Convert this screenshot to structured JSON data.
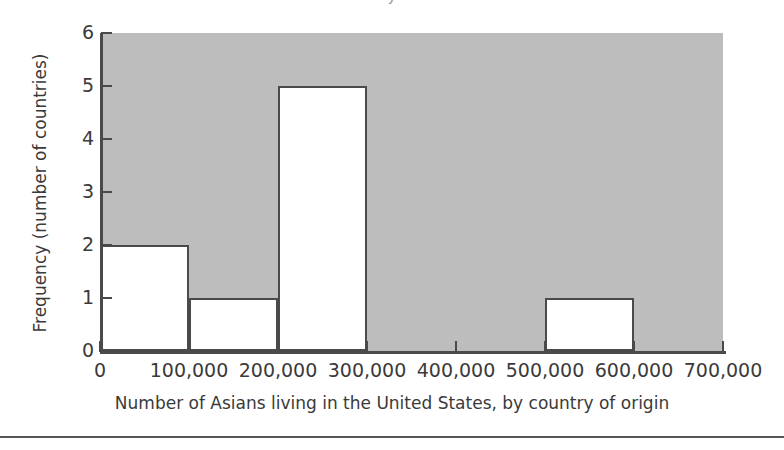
{
  "figure": {
    "title_fragment": "y",
    "x_axis_title": "Number of Asians living in the United States, by country of origin",
    "y_axis_title": "Frequency (number of countries)"
  },
  "chart_data": {
    "type": "bar",
    "title": "",
    "xlabel": "Number of Asians living in the United States, by country of origin",
    "ylabel": "Frequency (number of countries)",
    "xlim": [
      0,
      700000
    ],
    "ylim": [
      0,
      6
    ],
    "grid": false,
    "legend": "none",
    "bin_width": 100000,
    "bin_edges": [
      0,
      100000,
      200000,
      300000,
      400000,
      500000,
      600000,
      700000
    ],
    "categories": [
      "0-100,000",
      "100,000-200,000",
      "200,000-300,000",
      "300,000-400,000",
      "400,000-500,000",
      "500,000-600,000",
      "600,000-700,000"
    ],
    "values": [
      2,
      1,
      5,
      0,
      0,
      1,
      0
    ],
    "xticks": [
      0,
      100000,
      200000,
      300000,
      400000,
      500000,
      600000,
      700000
    ],
    "xticklabels": [
      "0",
      "100,000",
      "200,000",
      "300,000",
      "400,000",
      "500,000",
      "600,000",
      "700,000"
    ],
    "yticks": [
      0,
      1,
      2,
      3,
      4,
      5,
      6
    ],
    "yticklabels": [
      "0",
      "1",
      "2",
      "3",
      "4",
      "5",
      "6"
    ],
    "colors": {
      "panel_background": "#bdbdbd",
      "bar_fill": "#ffffff",
      "bar_edge": "#4a4a4a",
      "axis": "#4a4a4a",
      "text": "#3a3a3a",
      "page_background": "#ffffff"
    }
  }
}
